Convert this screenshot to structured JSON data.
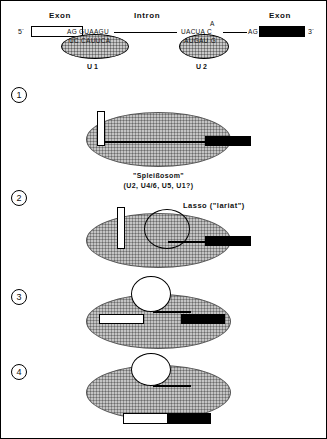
{
  "figure": {
    "title_labels": {
      "exon_left": "Exon",
      "intron": "Intron",
      "exon_right": "Exon"
    },
    "ends": {
      "five_prime": "5´",
      "three_prime": "3´"
    }
  },
  "top_panel": {
    "splice_site_5": "AG",
    "donor_seq": "GUAAGU",
    "u1_seq": "UC  CAUUCA",
    "u1_label": "U 1",
    "branch_point_a": "A",
    "acceptor_seq": "UACUA C",
    "u2_seq": "AUGAU G",
    "u2_label": "U 2",
    "splice_site_3": "AG"
  },
  "steps": [
    {
      "number": "1",
      "caption_line1": "\"Spleißosom\"",
      "caption_line2": "(U2,   U4/6,   U5,   U1?)"
    },
    {
      "number": "2",
      "callout": "Lasso   (\"lariat\")"
    },
    {
      "number": "3"
    },
    {
      "number": "4"
    }
  ],
  "colors": {
    "ink": "#000000",
    "snrnp_fill": "#c9c9c9",
    "spliceosome_fill": "#c4c4c4",
    "exon_open": "#ffffff",
    "exon_filled": "#000000"
  }
}
